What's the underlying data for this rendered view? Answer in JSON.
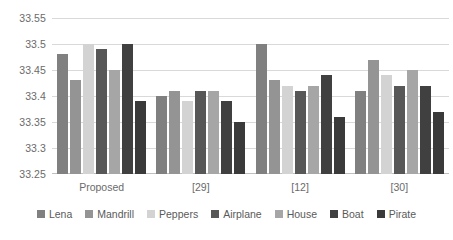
{
  "chart_data": {
    "type": "bar",
    "title": "",
    "subtitle": "",
    "xlabel": "",
    "ylabel": "",
    "ylim": [
      33.25,
      33.55
    ],
    "yticks": [
      "33.25",
      "33.3",
      "33.35",
      "33.4",
      "33.45",
      "33.5",
      "33.55"
    ],
    "ytick_values": [
      33.25,
      33.3,
      33.35,
      33.4,
      33.45,
      33.5,
      33.55
    ],
    "grid": true,
    "legend_position": "bottom",
    "categories": [
      "Proposed",
      "[29]",
      "[12]",
      "[30]"
    ],
    "series": [
      {
        "name": "Lena",
        "color": "#808080",
        "values": [
          33.48,
          33.4,
          33.5,
          33.41
        ]
      },
      {
        "name": "Mandrill",
        "color": "#949494",
        "values": [
          33.43,
          33.41,
          33.43,
          33.47
        ]
      },
      {
        "name": "Peppers",
        "color": "#d3d3d3",
        "values": [
          33.5,
          33.39,
          33.42,
          33.44
        ]
      },
      {
        "name": "Airplane",
        "color": "#575757",
        "values": [
          33.49,
          33.41,
          33.41,
          33.42
        ]
      },
      {
        "name": "House",
        "color": "#a6a6a6",
        "values": [
          33.45,
          33.41,
          33.42,
          33.45
        ]
      },
      {
        "name": "Boat",
        "color": "#404040",
        "values": [
          33.5,
          33.39,
          33.44,
          33.42
        ]
      },
      {
        "name": "Pirate",
        "color": "#3a3a3a",
        "values": [
          33.39,
          33.35,
          33.36,
          33.37
        ]
      }
    ]
  }
}
